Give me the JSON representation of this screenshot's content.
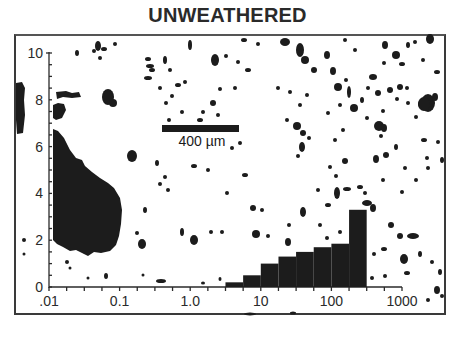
{
  "title": "UNWEATHERED",
  "scale_bar": {
    "label": "400 µm",
    "length_um": 400
  },
  "chart_data": {
    "type": "bar",
    "title": "UNWEATHERED",
    "subtitle": "",
    "xlabel": "",
    "ylabel": "",
    "x_scale": "log",
    "xlim": [
      0.01,
      1000
    ],
    "ylim": [
      0,
      10
    ],
    "grid": false,
    "legend": null,
    "x_tick_labels": [
      ".01",
      "0.1",
      "1.0",
      "10",
      "100",
      "1000"
    ],
    "x_tick_values": [
      0.01,
      0.1,
      1,
      10,
      100,
      1000
    ],
    "y_tick_labels": [
      "0",
      "2",
      "4",
      "6",
      "8",
      "10"
    ],
    "y_tick_values": [
      0,
      2,
      4,
      6,
      8,
      10
    ],
    "bin_edges": [
      3.16,
      5.62,
      10,
      17.8,
      31.6,
      56.2,
      100,
      178,
      316
    ],
    "categories": [
      "3.2-5.6",
      "5.6-10",
      "10-18",
      "18-32",
      "32-56",
      "56-100",
      "100-178",
      "178-316"
    ],
    "values": [
      0.2,
      0.5,
      1.0,
      1.3,
      1.5,
      1.7,
      1.85,
      3.3
    ],
    "annotations": [
      "400 µm scale bar overlaid on binary particle image background"
    ]
  },
  "colors": {
    "ink": "#1c1c1c",
    "background": "#ffffff",
    "frame": "#3a3a3a"
  }
}
